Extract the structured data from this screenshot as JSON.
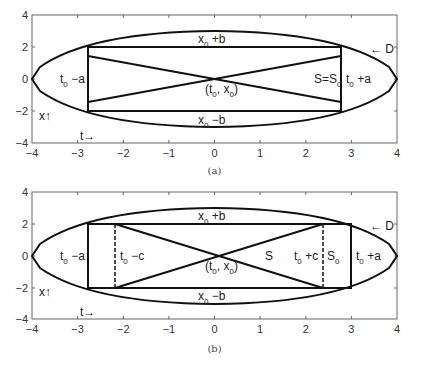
{
  "figure": {
    "panels": [
      {
        "id": "a",
        "caption": "(a)",
        "xticks": [
          "−4",
          "−3",
          "−2",
          "−1",
          "0",
          "1",
          "2",
          "3",
          "4"
        ],
        "yticks": [
          "4",
          "2",
          "0",
          "−2",
          "−4"
        ],
        "labels": {
          "top": "x",
          "top_sub": "0",
          "top_rest": " +b",
          "bottom": "x",
          "bottom_sub": "0",
          "bottom_rest": " −b",
          "left": "t",
          "left_sub": "0",
          "left_rest": " −a",
          "right": "t",
          "right_sub": "0",
          "right_rest": " +a",
          "center_open": "(t",
          "center_sub1": "0",
          "center_mid": ", x",
          "center_sub2": "0",
          "center_close": ")",
          "region": "S=S",
          "region_sub": "0",
          "domain": "← D",
          "x_axis_hint": "x↑",
          "t_axis_hint": "t→"
        }
      },
      {
        "id": "b",
        "caption": "(b)",
        "xticks": [
          "−4",
          "−3",
          "−2",
          "−1",
          "0",
          "1",
          "2",
          "3",
          "4"
        ],
        "yticks": [
          "4",
          "2",
          "0",
          "−2",
          "−4"
        ],
        "labels": {
          "top": "x",
          "top_sub": "0",
          "top_rest": " +b",
          "bottom": "x",
          "bottom_sub": "0",
          "bottom_rest": " −b",
          "left": "t",
          "left_sub": "0",
          "left_rest": " −a",
          "left_inner": "t",
          "left_inner_sub": "0",
          "left_inner_rest": " −c",
          "right_inner": "t",
          "right_inner_sub": "0",
          "right_inner_rest": " +c",
          "right": "t",
          "right_sub": "0",
          "right_rest": " +a",
          "center_open": "(t",
          "center_sub1": "0",
          "center_mid": ", x",
          "center_sub2": "0",
          "center_close": ")",
          "region": "S",
          "region0": "S",
          "region0_sub": "0",
          "domain": "← D",
          "x_axis_hint": "x↑",
          "t_axis_hint": "t→"
        }
      }
    ]
  }
}
